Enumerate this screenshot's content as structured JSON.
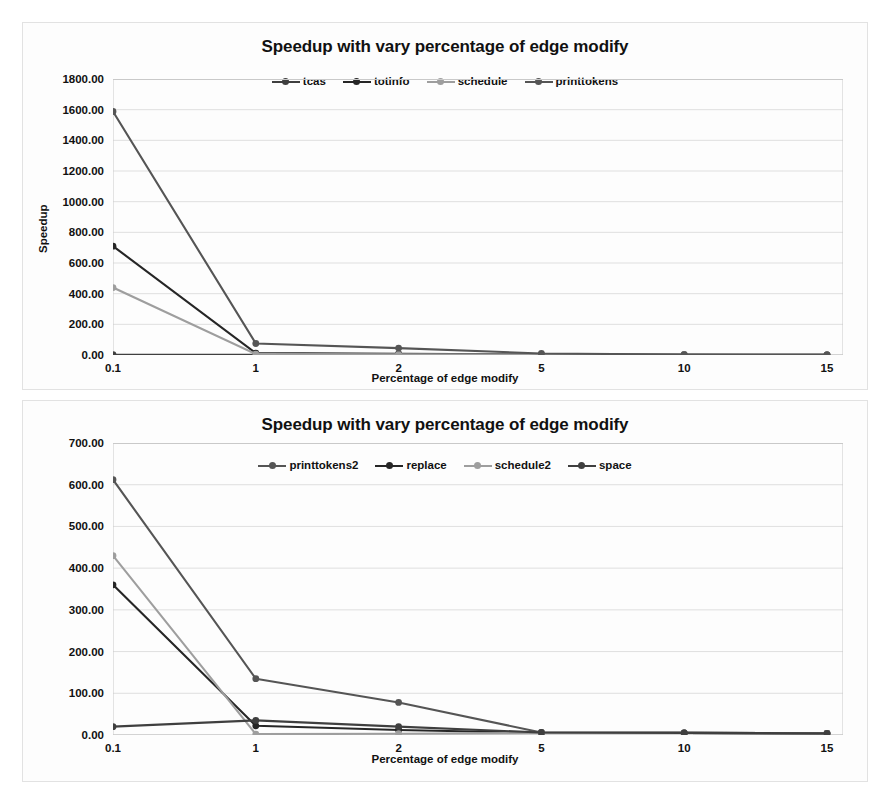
{
  "chart_data": [
    {
      "type": "line",
      "title": "Speedup with vary percentage of edge modify",
      "xlabel": "Percentage of edge modify",
      "ylabel": "Speedup",
      "categories": [
        "0.1",
        "1",
        "2",
        "5",
        "10",
        "15"
      ],
      "ylim": [
        0,
        1800
      ],
      "yticks": [
        "0.00",
        "200.00",
        "400.00",
        "600.00",
        "800.00",
        "1000.00",
        "1200.00",
        "1400.00",
        "1600.00",
        "1800.00"
      ],
      "ytick_values": [
        0,
        200,
        400,
        600,
        800,
        1000,
        1200,
        1400,
        1600,
        1800
      ],
      "grid": true,
      "legend_position": "top-center",
      "series": [
        {
          "name": "tcas",
          "color": "#3f3f3f",
          "values": [
            2.0,
            1.5,
            1.2,
            1.0,
            1.0,
            1.0
          ]
        },
        {
          "name": "totinfo",
          "color": "#262626",
          "values": [
            710.0,
            12.0,
            8.0,
            3.0,
            1.5,
            1.0
          ]
        },
        {
          "name": "schedule",
          "color": "#9e9e9e",
          "values": [
            440.0,
            6.0,
            4.0,
            2.0,
            1.5,
            1.0
          ]
        },
        {
          "name": "printtokens",
          "color": "#555555",
          "values": [
            1588.0,
            75.0,
            45.0,
            10.0,
            3.0,
            1.0
          ]
        }
      ]
    },
    {
      "type": "line",
      "title": "Speedup with vary percentage of edge modify",
      "xlabel": "Percentage of edge modify",
      "ylabel": "Speedup",
      "categories": [
        "0.1",
        "1",
        "2",
        "5",
        "10",
        "15"
      ],
      "ylim": [
        0,
        700
      ],
      "yticks": [
        "0.00",
        "100.00",
        "200.00",
        "300.00",
        "400.00",
        "500.00",
        "600.00",
        "700.00"
      ],
      "ytick_values": [
        0,
        100,
        200,
        300,
        400,
        500,
        600,
        700
      ],
      "grid": true,
      "legend_position": "top-center",
      "series": [
        {
          "name": "printtokens2",
          "color": "#555555",
          "values": [
            612.0,
            135.0,
            78.0,
            6.0,
            5.0,
            4.0
          ]
        },
        {
          "name": "replace",
          "color": "#262626",
          "values": [
            360.0,
            22.0,
            12.0,
            5.0,
            5.0,
            4.0
          ]
        },
        {
          "name": "schedule2",
          "color": "#9e9e9e",
          "values": [
            430.0,
            2.0,
            3.0,
            5.0,
            5.0,
            4.0
          ]
        },
        {
          "name": "space",
          "color": "#3f3f3f",
          "values": [
            20.0,
            35.0,
            20.0,
            6.0,
            5.0,
            4.0
          ]
        }
      ]
    }
  ]
}
